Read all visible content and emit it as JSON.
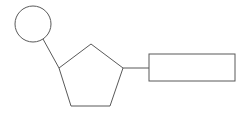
{
  "diagram": {
    "type": "nucleotide-schematic",
    "stroke_color": "#595959",
    "background": "#ffffff",
    "labels": [],
    "shapes": {
      "phosphate_circle": {
        "cx": 33,
        "cy": 24,
        "r": 18
      },
      "sugar_pentagon": {
        "points": "91,44 123,68 110,106 71,106 59,68"
      },
      "base_rectangle": {
        "x": 149,
        "y": 54,
        "width": 86,
        "height": 27
      }
    },
    "connectors": {
      "circle_to_pentagon": {
        "x1": 43,
        "y1": 39,
        "x2": 59,
        "y2": 68
      },
      "pentagon_to_rectangle": {
        "x1": 123,
        "y1": 68,
        "x2": 149,
        "y2": 68
      }
    }
  }
}
